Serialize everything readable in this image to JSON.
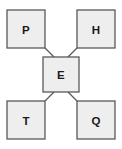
{
  "diagram": {
    "title": "",
    "type": "node-link-diagram",
    "canvas": {
      "width": 122,
      "height": 149,
      "background": "#ffffff"
    },
    "style": {
      "node_fill": "#eeeeee",
      "node_stroke": "#595959",
      "label_color": "#1a1a1a",
      "edge_stroke": "#595959"
    },
    "nodes": [
      {
        "id": "P",
        "label": "P",
        "role": "top-left",
        "x": 7,
        "y": 10,
        "w": 38,
        "h": 38,
        "cx": 26,
        "cy": 29
      },
      {
        "id": "H",
        "label": "H",
        "role": "top-right",
        "x": 77,
        "y": 10,
        "w": 38,
        "h": 38,
        "cx": 96,
        "cy": 29
      },
      {
        "id": "E",
        "label": "E",
        "role": "center",
        "x": 43,
        "y": 57,
        "w": 36,
        "h": 35,
        "cx": 61,
        "cy": 74
      },
      {
        "id": "T",
        "label": "T",
        "role": "bottom-left",
        "x": 7,
        "y": 101,
        "w": 38,
        "h": 38,
        "cx": 26,
        "cy": 120
      },
      {
        "id": "Q",
        "label": "Q",
        "role": "bottom-right",
        "x": 77,
        "y": 101,
        "w": 38,
        "h": 38,
        "cx": 96,
        "cy": 120
      }
    ],
    "edges": [
      {
        "id": "P-E",
        "from": "P",
        "to": "E",
        "x1": 45,
        "y1": 48,
        "x2": 54,
        "y2": 57
      },
      {
        "id": "H-E",
        "from": "H",
        "to": "E",
        "x1": 77,
        "y1": 48,
        "x2": 68,
        "y2": 57
      },
      {
        "id": "T-E",
        "from": "T",
        "to": "E",
        "x1": 45,
        "y1": 101,
        "x2": 54,
        "y2": 92
      },
      {
        "id": "Q-E",
        "from": "Q",
        "to": "E",
        "x1": 77,
        "y1": 101,
        "x2": 68,
        "y2": 92
      }
    ]
  }
}
